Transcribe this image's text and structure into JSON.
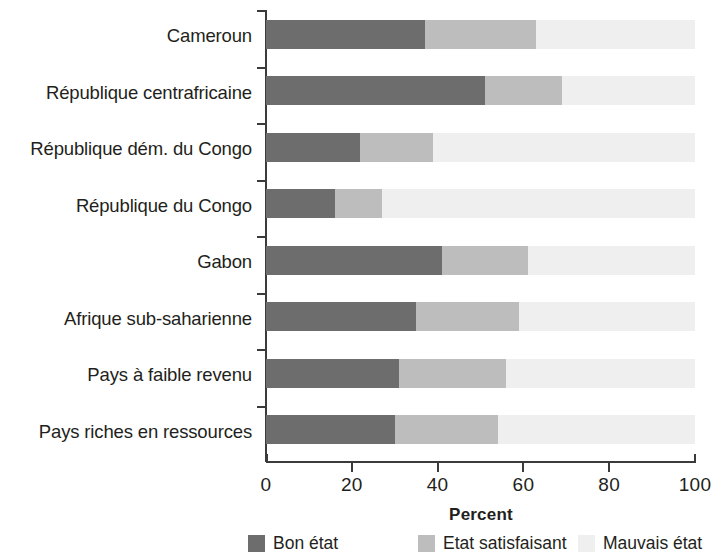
{
  "chart_data": {
    "type": "bar",
    "orientation": "horizontal",
    "stacked": true,
    "stack_normalized": true,
    "title": "",
    "xlabel": "Percent",
    "ylabel": "",
    "xlim": [
      0,
      100
    ],
    "xticks": [
      0,
      20,
      40,
      60,
      80,
      100
    ],
    "xticklabels": [
      "0",
      "20",
      "40",
      "60",
      "80",
      "100"
    ],
    "grid": false,
    "legend_position": "bottom",
    "categories": [
      "Cameroun",
      "République centrafricaine",
      "République dém. du Congo",
      "République du Congo",
      "Gabon",
      "Afrique sub-saharienne",
      "Pays à faible revenu",
      "Pays riches en ressources"
    ],
    "series": [
      {
        "name": "Bon état",
        "color": "#6d6d6d",
        "values": [
          37,
          51,
          22,
          16,
          41,
          35,
          31,
          30
        ]
      },
      {
        "name": "Etat satisfaisant",
        "color": "#bdbdbd",
        "values": [
          26,
          18,
          17,
          11,
          20,
          24,
          25,
          24
        ]
      },
      {
        "name": "Mauvais état",
        "color": "#efefef",
        "values": [
          37,
          31,
          61,
          73,
          39,
          41,
          44,
          46
        ]
      }
    ]
  },
  "axis": {
    "x_title": "Percent",
    "tick_labels": [
      "0",
      "20",
      "40",
      "60",
      "80",
      "100"
    ]
  },
  "legend": {
    "items": [
      {
        "label": "Bon état",
        "color": "#6d6d6d"
      },
      {
        "label": "Etat satisfaisant",
        "color": "#bdbdbd"
      },
      {
        "label": "Mauvais état",
        "color": "#efefef"
      }
    ]
  }
}
